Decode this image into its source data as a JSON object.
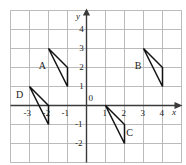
{
  "figure": {
    "title": "",
    "background_color": "#ffffff",
    "grid_color": "#b3b3b3",
    "axis_color": "#3a3a3a",
    "shape_color": "#111111"
  },
  "chart_data": {
    "type": "scatter",
    "title": "",
    "xlabel": "x",
    "ylabel": "y",
    "grid": true,
    "legend": "none",
    "xlim": [
      -4,
      5
    ],
    "ylim": [
      -3,
      5
    ],
    "x_tick_labels": [
      "-3",
      "-2",
      "-1",
      "0",
      "1",
      "2",
      "3",
      "4"
    ],
    "x_tick_values": [
      -3,
      -2,
      -1,
      0,
      1,
      2,
      3,
      4
    ],
    "y_tick_labels": [
      "4",
      "3",
      "2",
      "1",
      "0",
      "-1",
      "-2"
    ],
    "y_tick_values": [
      4,
      3,
      2,
      1,
      0,
      -1,
      -2
    ],
    "origin_label": "0",
    "shapes": [
      {
        "name": "A",
        "label": "A",
        "vertices": [
          [
            -2,
            3
          ],
          [
            -1,
            2
          ],
          [
            -1,
            1
          ],
          [
            -2,
            3
          ]
        ],
        "label_position": [
          -2.35,
          2.1
        ]
      },
      {
        "name": "B",
        "label": "B",
        "vertices": [
          [
            3,
            3
          ],
          [
            4,
            2
          ],
          [
            4,
            1
          ],
          [
            3,
            3
          ]
        ],
        "label_position": [
          2.7,
          2.1
        ]
      },
      {
        "name": "C",
        "label": "C",
        "vertices": [
          [
            1,
            0
          ],
          [
            2,
            -1
          ],
          [
            2,
            -2
          ],
          [
            1,
            0
          ]
        ],
        "label_position": [
          2.25,
          -1.45
        ]
      },
      {
        "name": "D",
        "label": "D",
        "vertices": [
          [
            -3,
            1
          ],
          [
            -2,
            0
          ],
          [
            -2,
            -1
          ],
          [
            -3,
            1
          ]
        ],
        "label_position": [
          -3.55,
          0.55
        ]
      }
    ]
  },
  "axis_labels": {
    "x_axis_name": "x",
    "y_axis_name": "y"
  }
}
